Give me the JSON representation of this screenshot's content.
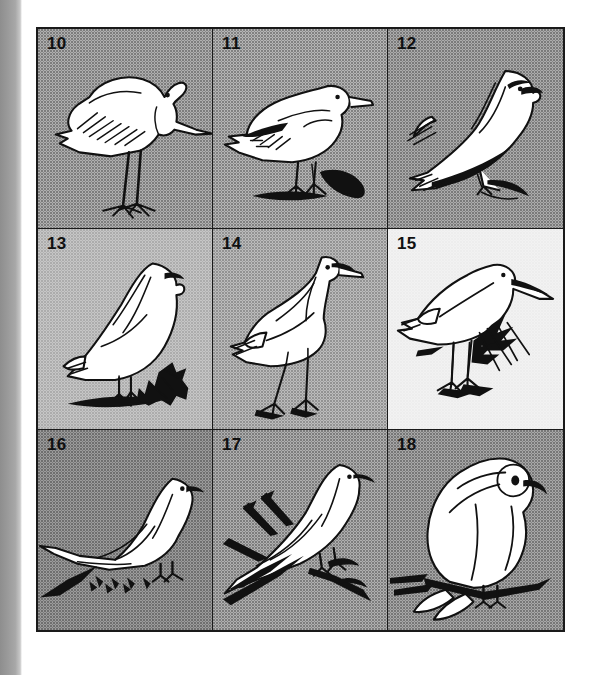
{
  "plate": {
    "caption_numbers_style": "bold-sans",
    "border_color": "#1a1a1a",
    "columns": 3,
    "rows": 3,
    "cells": [
      {
        "number": "10",
        "subject": "heron-standing",
        "background_hex": "#b0b0b0",
        "description": "Standing heron with long neck, dagger bill, long legs and hatched wing feathers"
      },
      {
        "number": "11",
        "subject": "goose-standing-on-ground",
        "background_hex": "#b6b6b6",
        "description": "Goose or duck standing on ground with barred wing tip and short bill"
      },
      {
        "number": "12",
        "subject": "falcon-perched-on-branch",
        "background_hex": "#acacac",
        "description": "Falcon perched on a branch, hooked bill, long pointed wings crossed over tail"
      },
      {
        "number": "13",
        "subject": "ptarmigan-on-ground-with-conifer-sprig",
        "background_hex": "#c6c6c6",
        "description": "Ptarmigan or grouse standing beside a conifer sprig"
      },
      {
        "number": "14",
        "subject": "crane-walking",
        "background_hex": "#bcbcbc",
        "description": "Crane walking with long neck raised, long bare legs and bustle of tail feathers"
      },
      {
        "number": "15",
        "subject": "sandpiper-in-grass",
        "background_hex": "#f2f2f2",
        "description": "Long-billed sandpiper or snipe standing among tufts of grass"
      },
      {
        "number": "16",
        "subject": "dove-long-tailed-on-ground",
        "background_hex": "#9c9c9c",
        "description": "Long-tailed dove standing on ground, tail sweeping down to the left"
      },
      {
        "number": "17",
        "subject": "dove-perched-on-twigs",
        "background_hex": "#b0b0b0",
        "description": "Dove perched on crossing twigs with long pointed tail"
      },
      {
        "number": "18",
        "subject": "parrot-perched-on-branch",
        "background_hex": "#a8a8a8",
        "description": "Stocky hook-billed bird, parrot-like, perched upright on a horizontal branch"
      }
    ]
  }
}
